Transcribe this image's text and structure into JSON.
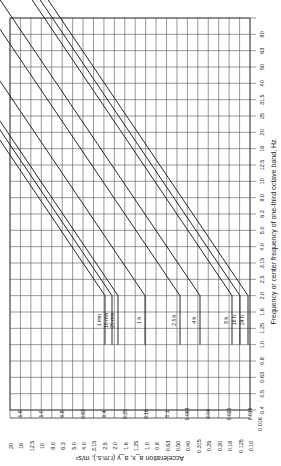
{
  "chart_data": {
    "type": "line",
    "orientation": "rotated-90-ccw",
    "xlabel": "Frequency or center frequency of one-third octave band, Hz",
    "ylabel": "Acceleration a_x, a_y (r.m.s.), m/s²",
    "frequency_ticks": [
      "0.016",
      "0.4",
      "0.5",
      "0.63",
      "0.8",
      "1.0",
      "1.25",
      "1.6",
      "2.0",
      "2.5",
      "3.15",
      "4.0",
      "5.0",
      "6.3",
      "8.0",
      "10",
      "12.5",
      "16",
      "20",
      "25",
      "31.5",
      "40",
      "50",
      "63",
      "80"
    ],
    "acceleration_ticks": [
      "20",
      "16",
      "12.5",
      "10",
      "8.0",
      "6.3",
      "5.0",
      "4.0",
      "3.15",
      "2.5",
      "2.0",
      "1.6",
      "1.25",
      "1.0",
      "0.8",
      "0.63",
      "0.50",
      "0.40",
      "0.315",
      "0.25",
      "0.20",
      "0.16",
      "0.125",
      "0.10"
    ],
    "series": [
      {
        "name": "1 min",
        "plateau": 1.6
      },
      {
        "name": "16 min",
        "plateau": 1.0
      },
      {
        "name": "25 min",
        "plateau": 0.8
      },
      {
        "name": "1 h",
        "plateau": 0.63
      },
      {
        "name": "2.5 h",
        "plateau": 0.4
      },
      {
        "name": "4 h",
        "plateau": 0.25
      },
      {
        "name": "8 h",
        "plateau": 0.16
      },
      {
        "name": "16 h",
        "plateau": 0.1
      },
      {
        "name": "24 h",
        "plateau": 0.063
      }
    ],
    "bottom_row_values": [
      "1.6",
      "1.0",
      "0.8",
      "0.63",
      "0.4",
      "0.25",
      "0.16",
      "0.1",
      "0.063",
      "0.04",
      "0.025",
      "0.016"
    ],
    "plateau_range_hz": [
      1.0,
      2.0
    ],
    "slope_note": "acceleration limit rises proportionally with frequency above 2 Hz"
  }
}
